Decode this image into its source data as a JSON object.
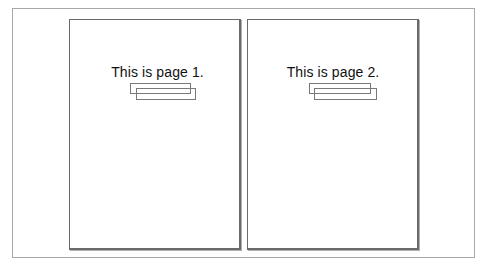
{
  "preview": {
    "pages": [
      {
        "number": 1,
        "text": "This is page 1.",
        "boxes": [
          {
            "left": 60,
            "top": 63,
            "width": 61,
            "height": 11
          },
          {
            "left": 66,
            "top": 68,
            "width": 60,
            "height": 12
          }
        ]
      },
      {
        "number": 2,
        "text": "This is page 2.",
        "boxes": [
          {
            "left": 61,
            "top": 63,
            "width": 62,
            "height": 11
          },
          {
            "left": 66,
            "top": 68,
            "width": 63,
            "height": 12
          }
        ]
      }
    ]
  },
  "colors": {
    "page_border": "#6a6a6a",
    "frame_border": "#a8a8a8",
    "box_border": "#7a7a7a",
    "text": "#111111",
    "background": "#ffffff"
  }
}
